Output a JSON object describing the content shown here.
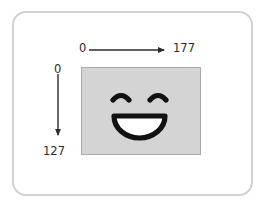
{
  "diagram": {
    "frame": {
      "name": "rounded-frame"
    },
    "image_canvas": {
      "name": "image-area",
      "fill_color": "#d4d4d4",
      "border_color": "#a9a9a9",
      "content": "smiley-face"
    },
    "face": {
      "left_eye": "closed-curved-eye",
      "right_eye": "closed-curved-eye",
      "mouth": "open-smile",
      "stroke_color": "#111111",
      "mouth_fill": "#ffffff"
    },
    "x_axis": {
      "name": "horizontal-axis",
      "start_label": "0",
      "end_label": "177",
      "direction": "left-to-right",
      "color": "#2b2b2b"
    },
    "y_axis": {
      "name": "vertical-axis",
      "start_label": "0",
      "end_label": "127",
      "direction": "top-to-bottom",
      "color": "#2b2b2b"
    }
  }
}
